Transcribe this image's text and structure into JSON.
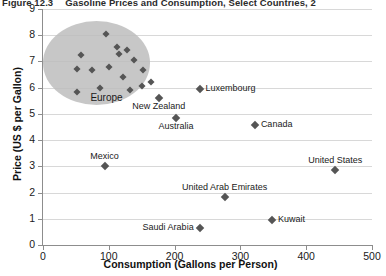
{
  "figure": {
    "number": "Figure 12.3",
    "title": "Gasoline Prices and Consumption, Select Countries, 2"
  },
  "chart_data": {
    "type": "scatter",
    "title": "Gasoline Prices and Consumption, Select Countries, 2",
    "xlabel": "Consumption (Gallons per Person)",
    "ylabel": "Price (US $ per Gallon)",
    "xlim": [
      0,
      500
    ],
    "ylim": [
      0,
      9
    ],
    "xticks": [
      0,
      100,
      200,
      300,
      400,
      500
    ],
    "yticks": [
      0,
      1,
      2,
      3,
      4,
      5,
      6,
      7,
      8,
      9
    ],
    "grid": "horizontal",
    "legend": "none",
    "points": [
      {
        "label": "Luxembourg",
        "x": 238,
        "y": 5.95,
        "label_pos": "right"
      },
      {
        "label": "New Zealand",
        "x": 176,
        "y": 5.62,
        "label_pos": "below"
      },
      {
        "label": "Australia",
        "x": 202,
        "y": 4.85,
        "label_pos": "below"
      },
      {
        "label": "Canada",
        "x": 322,
        "y": 4.58,
        "label_pos": "right"
      },
      {
        "label": "United States",
        "x": 444,
        "y": 2.85,
        "label_pos": "above"
      },
      {
        "label": "Mexico",
        "x": 94,
        "y": 3.0,
        "label_pos": "above"
      },
      {
        "label": "United Arab Emirates",
        "x": 276,
        "y": 1.82,
        "label_pos": "above"
      },
      {
        "label": "Kuwait",
        "x": 348,
        "y": 0.95,
        "label_pos": "right"
      },
      {
        "label": "Saudi Arabia",
        "x": 238,
        "y": 0.65,
        "label_pos": "left"
      }
    ],
    "cluster": {
      "label": "Europe",
      "shape": "ellipse",
      "x_range": [
        0,
        163
      ],
      "y_range": [
        5.35,
        8.55
      ],
      "points": [
        {
          "x": 58,
          "y": 7.25
        },
        {
          "x": 52,
          "y": 6.7
        },
        {
          "x": 74,
          "y": 6.68
        },
        {
          "x": 96,
          "y": 8.05
        },
        {
          "x": 100,
          "y": 6.78
        },
        {
          "x": 116,
          "y": 7.3
        },
        {
          "x": 128,
          "y": 7.45
        },
        {
          "x": 138,
          "y": 7.05
        },
        {
          "x": 112,
          "y": 7.55
        },
        {
          "x": 122,
          "y": 6.4
        },
        {
          "x": 152,
          "y": 6.68
        },
        {
          "x": 86,
          "y": 5.98
        },
        {
          "x": 52,
          "y": 5.82
        },
        {
          "x": 132,
          "y": 5.9
        },
        {
          "x": 150,
          "y": 6.05
        },
        {
          "x": 164,
          "y": 6.2
        }
      ]
    }
  },
  "axes": {
    "y_tick_labels": [
      "9",
      "8",
      "7",
      "6",
      "5",
      "4",
      "3",
      "2",
      "1",
      "0"
    ],
    "x_tick_labels": [
      "0",
      "100",
      "200",
      "300",
      "400",
      "500"
    ],
    "x_title": "Consumption (Gallons per Person)",
    "y_title": "Price (US $ per Gallon)"
  }
}
